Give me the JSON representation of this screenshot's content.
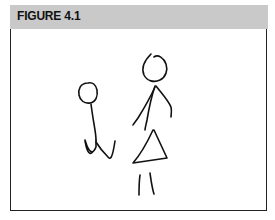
{
  "figure": {
    "title": "FIGURE 4.1",
    "header_color": "#c9c9c9",
    "border_color": "#222222",
    "drawing_description": "Hand-drawn stick figures: small plain stick figure on the left, larger figure with triangle dress on the right"
  }
}
